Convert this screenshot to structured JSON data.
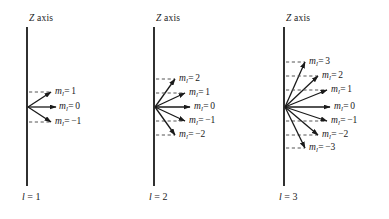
{
  "figure": {
    "background_color": "#ffffff",
    "line_color": "#1a1a1a",
    "dash_color": "#555555"
  },
  "panels": [
    {
      "id": "panel-l1",
      "axis_title": "Z axis",
      "axis_title_z": "Z",
      "axis_title_rest": " axis",
      "bottom_label_var": "l",
      "bottom_label_eq": "=",
      "bottom_label_value": "1",
      "quantum_number_l": 1,
      "axis_x": 27,
      "axis_top": 27,
      "axis_bottom": 186,
      "origin_x": 28,
      "origin_y": 107,
      "states": [
        {
          "m_text": "m",
          "sub": "l",
          "eq": "=",
          "value": "1",
          "m": 1,
          "tip_x": 51,
          "tip_y": 92,
          "dash_y": 92,
          "label_x": 55,
          "label_y": 86
        },
        {
          "m_text": "m",
          "sub": "l",
          "eq": "=",
          "value": "0",
          "m": 0,
          "tip_x": 56,
          "tip_y": 107,
          "dash_y": null,
          "label_x": 59,
          "label_y": 101
        },
        {
          "m_text": "m",
          "sub": "l",
          "eq": "=",
          "value": "−1",
          "m": -1,
          "tip_x": 51,
          "tip_y": 122,
          "dash_y": 122,
          "label_x": 55,
          "label_y": 116
        }
      ]
    },
    {
      "id": "panel-l2",
      "axis_title": "Z axis",
      "axis_title_z": "Z",
      "axis_title_rest": " axis",
      "bottom_label_var": "l",
      "bottom_label_eq": "=",
      "bottom_label_value": "2",
      "quantum_number_l": 2,
      "axis_x": 154,
      "axis_top": 27,
      "axis_bottom": 186,
      "origin_x": 155,
      "origin_y": 107,
      "states": [
        {
          "m_text": "m",
          "sub": "l",
          "eq": "=",
          "value": "2",
          "m": 2,
          "tip_x": 175,
          "tip_y": 79,
          "dash_y": 79,
          "label_x": 179,
          "label_y": 73
        },
        {
          "m_text": "m",
          "sub": "l",
          "eq": "=",
          "value": "1",
          "m": 1,
          "tip_x": 185,
          "tip_y": 93,
          "dash_y": 93,
          "label_x": 189,
          "label_y": 87
        },
        {
          "m_text": "m",
          "sub": "l",
          "eq": "=",
          "value": "0",
          "m": 0,
          "tip_x": 190,
          "tip_y": 107,
          "dash_y": null,
          "label_x": 194,
          "label_y": 101
        },
        {
          "m_text": "m",
          "sub": "l",
          "eq": "=",
          "value": "−1",
          "m": -1,
          "tip_x": 185,
          "tip_y": 121,
          "dash_y": 121,
          "label_x": 189,
          "label_y": 115
        },
        {
          "m_text": "m",
          "sub": "l",
          "eq": "=",
          "value": "−2",
          "m": -2,
          "tip_x": 175,
          "tip_y": 135,
          "dash_y": 135,
          "label_x": 179,
          "label_y": 129
        }
      ]
    },
    {
      "id": "panel-l3",
      "axis_title": "Z axis",
      "axis_title_z": "Z",
      "axis_title_rest": " axis",
      "bottom_label_var": "l",
      "bottom_label_eq": "=",
      "bottom_label_value": "3",
      "quantum_number_l": 3,
      "axis_x": 284,
      "axis_top": 27,
      "axis_bottom": 186,
      "origin_x": 285,
      "origin_y": 107,
      "states": [
        {
          "m_text": "m",
          "sub": "l",
          "eq": "=",
          "value": "3",
          "m": 3,
          "tip_x": 305,
          "tip_y": 62,
          "dash_y": 62,
          "label_x": 309,
          "label_y": 56
        },
        {
          "m_text": "m",
          "sub": "l",
          "eq": "=",
          "value": "2",
          "m": 2,
          "tip_x": 318,
          "tip_y": 76,
          "dash_y": 76,
          "label_x": 322,
          "label_y": 70
        },
        {
          "m_text": "m",
          "sub": "l",
          "eq": "=",
          "value": "1",
          "m": 1,
          "tip_x": 327,
          "tip_y": 90,
          "dash_y": 90,
          "label_x": 331,
          "label_y": 84
        },
        {
          "m_text": "m",
          "sub": "l",
          "eq": "=",
          "value": "0",
          "m": 0,
          "tip_x": 330,
          "tip_y": 107,
          "dash_y": null,
          "label_x": 334,
          "label_y": 101
        },
        {
          "m_text": "m",
          "sub": "l",
          "eq": "=",
          "value": "−1",
          "m": -1,
          "tip_x": 327,
          "tip_y": 121,
          "dash_y": 121,
          "label_x": 331,
          "label_y": 115
        },
        {
          "m_text": "m",
          "sub": "l",
          "eq": "=",
          "value": "−2",
          "m": -2,
          "tip_x": 318,
          "tip_y": 135,
          "dash_y": 135,
          "label_x": 322,
          "label_y": 129
        },
        {
          "m_text": "m",
          "sub": "l",
          "eq": "=",
          "value": "−3",
          "m": -3,
          "tip_x": 305,
          "tip_y": 148,
          "dash_y": 148,
          "label_x": 309,
          "label_y": 142
        }
      ]
    }
  ],
  "axis_title_positions": [
    {
      "x": 29,
      "y": 13
    },
    {
      "x": 156,
      "y": 13
    },
    {
      "x": 286,
      "y": 13
    }
  ],
  "bottom_label_positions": [
    {
      "x": 22,
      "y": 191
    },
    {
      "x": 149,
      "y": 191
    },
    {
      "x": 279,
      "y": 191
    }
  ]
}
